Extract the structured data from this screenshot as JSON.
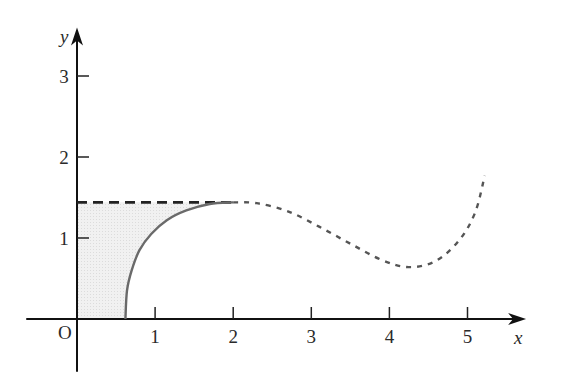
{
  "chart_data": {
    "type": "line",
    "title": "",
    "xlabel": "x",
    "ylabel": "y",
    "origin_label": "O",
    "xlim": [
      -0.65,
      5.75
    ],
    "ylim": [
      -0.65,
      3.6
    ],
    "x_ticks": [
      1,
      2,
      3,
      4,
      5
    ],
    "x_tick_labels": [
      "1",
      "2",
      "3",
      "4",
      "5"
    ],
    "y_ticks": [
      1,
      2,
      3
    ],
    "y_tick_labels": [
      "1",
      "2",
      "3"
    ],
    "grid": false,
    "legend": "none",
    "series": [
      {
        "name": "solid-curve",
        "style": "solid",
        "color": "#6a6a6a",
        "points": [
          [
            0.62,
            0.0
          ],
          [
            0.64,
            0.35
          ],
          [
            0.7,
            0.6
          ],
          [
            0.8,
            0.85
          ],
          [
            0.95,
            1.05
          ],
          [
            1.15,
            1.22
          ],
          [
            1.4,
            1.34
          ],
          [
            1.7,
            1.42
          ],
          [
            2.0,
            1.44
          ]
        ]
      },
      {
        "name": "dashed-curve",
        "style": "dotted",
        "color": "#555555",
        "points": [
          [
            2.0,
            1.44
          ],
          [
            2.3,
            1.43
          ],
          [
            2.7,
            1.33
          ],
          [
            3.1,
            1.14
          ],
          [
            3.5,
            0.93
          ],
          [
            3.9,
            0.73
          ],
          [
            4.25,
            0.64
          ],
          [
            4.6,
            0.72
          ],
          [
            4.9,
            0.98
          ],
          [
            5.1,
            1.32
          ],
          [
            5.22,
            1.77
          ]
        ]
      },
      {
        "name": "horizontal-dashed-line",
        "style": "dashed",
        "color": "#222222",
        "points": [
          [
            0,
            1.44
          ],
          [
            2.0,
            1.44
          ]
        ]
      }
    ],
    "shaded_region": {
      "description": "region bounded by y-axis, x-axis, solid curve and horizontal line y=1.44",
      "color": "#ececec"
    }
  }
}
